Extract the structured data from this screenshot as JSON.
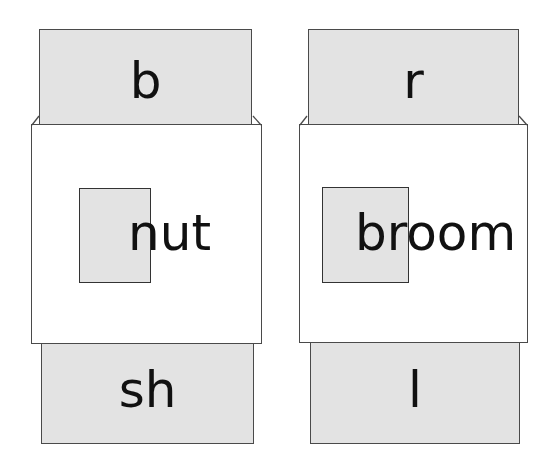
{
  "strips": [
    {
      "top_card": "b",
      "window_letters": "n",
      "word_rest": "ut",
      "bottom_card": "sh"
    },
    {
      "top_card": "r",
      "window_letters": "br",
      "word_rest": "oom",
      "bottom_card": "l"
    }
  ],
  "colors": {
    "card_fill": "#e3e3e3",
    "border": "#4a4a4a",
    "sleeve_fill": "#ffffff"
  }
}
